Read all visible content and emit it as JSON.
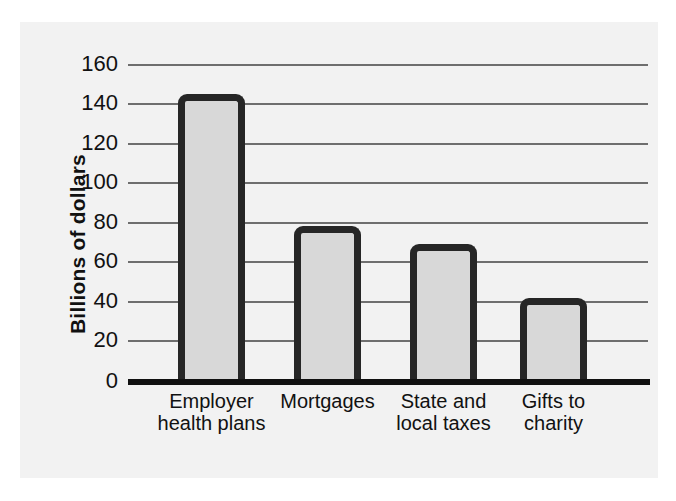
{
  "chart_data": {
    "type": "bar",
    "title": "",
    "xlabel": "",
    "ylabel": "Billions of dollars",
    "categories": [
      "Employer health plans",
      "Mortgages",
      "State and local taxes",
      "Gifts to charity"
    ],
    "category_lines": [
      [
        "Employer",
        "health plans"
      ],
      [
        "Mortgages",
        ""
      ],
      [
        "State and",
        "local taxes"
      ],
      [
        "Gifts to",
        "charity"
      ]
    ],
    "values": [
      145,
      78,
      69,
      42
    ],
    "ylim": [
      0,
      160
    ],
    "ytick_step": 20,
    "yticks": [
      "160",
      "140",
      "120",
      "100",
      "80",
      "60",
      "40",
      "20",
      "0"
    ],
    "ytick_values": [
      160,
      140,
      120,
      100,
      80,
      60,
      40,
      20,
      0
    ],
    "grid": true,
    "legend": false,
    "colors": {
      "bar_fill": "#d8d8d8",
      "bar_border": "#262626",
      "gridline": "#6e6e6e",
      "axis": "#111111",
      "panel_background": "#f2f2f2",
      "page_background": "#ffffff",
      "text": "#111111"
    }
  }
}
